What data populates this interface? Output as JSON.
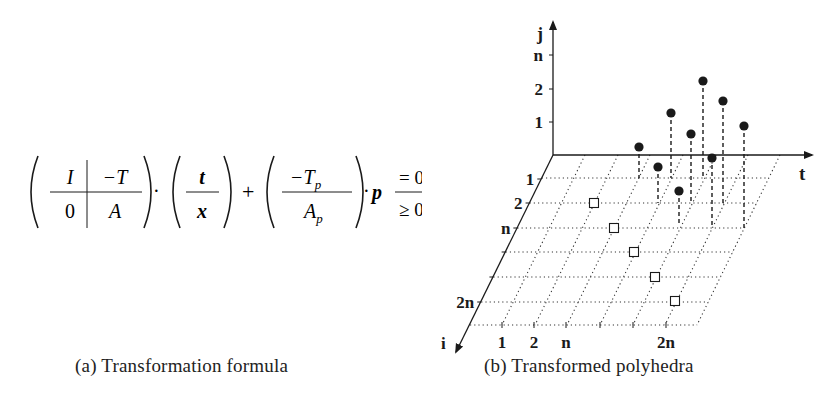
{
  "formula": {
    "matrix_top_left": "I",
    "matrix_top_right": "−T",
    "matrix_bottom_left": "0",
    "matrix_bottom_right": "A",
    "dot1": "·",
    "vector_top": "t",
    "vector_bottom": "x",
    "plus": "+",
    "param_top": "−T",
    "param_top_sub": "p",
    "param_bottom": "A",
    "param_bottom_sub": "p",
    "dot2": "·",
    "p": "p",
    "rel_top": "= 0",
    "rel_bottom": "≥ 0"
  },
  "captions": {
    "a": "(a) Transformation formula",
    "b": "(b) Transformed polyhedra"
  },
  "figure": {
    "axes": {
      "j": "j",
      "t": "t",
      "i": "i"
    },
    "j_ticks": [
      {
        "label": "n",
        "y": 55
      },
      {
        "label": "2",
        "y": 89
      },
      {
        "label": "1",
        "y": 122
      }
    ],
    "i_ticks": [
      {
        "label": "1",
        "y": 179
      },
      {
        "label": "2",
        "y": 203
      },
      {
        "label": "n",
        "y": 228
      },
      {
        "label": "",
        "y": 252
      },
      {
        "label": "",
        "y": 277
      },
      {
        "label": "2n",
        "y": 302
      }
    ],
    "bottom_ticks": [
      {
        "label": "1",
        "x": 502
      },
      {
        "label": "2",
        "x": 534
      },
      {
        "label": "n",
        "x": 566
      },
      {
        "label": "",
        "x": 600
      },
      {
        "label": "",
        "x": 633
      },
      {
        "label": "2n",
        "x": 666
      }
    ],
    "filled_points": [
      {
        "x": 639,
        "y": 147,
        "base": 178
      },
      {
        "x": 658,
        "y": 167,
        "base": 203
      },
      {
        "x": 671,
        "y": 113,
        "base": 178
      },
      {
        "x": 679,
        "y": 191,
        "base": 226
      },
      {
        "x": 691,
        "y": 134,
        "base": 203
      },
      {
        "x": 703,
        "y": 81,
        "base": 178
      },
      {
        "x": 712,
        "y": 158,
        "base": 228
      },
      {
        "x": 723,
        "y": 101,
        "base": 203
      },
      {
        "x": 744,
        "y": 126,
        "base": 228
      }
    ],
    "open_points": [
      {
        "x": 594,
        "y": 203
      },
      {
        "x": 614,
        "y": 228
      },
      {
        "x": 634,
        "y": 252
      },
      {
        "x": 655,
        "y": 277
      },
      {
        "x": 675,
        "y": 301
      }
    ],
    "colors": {
      "ink": "#1a1a1a",
      "grid": "#333333",
      "background": "#ffffff"
    }
  }
}
